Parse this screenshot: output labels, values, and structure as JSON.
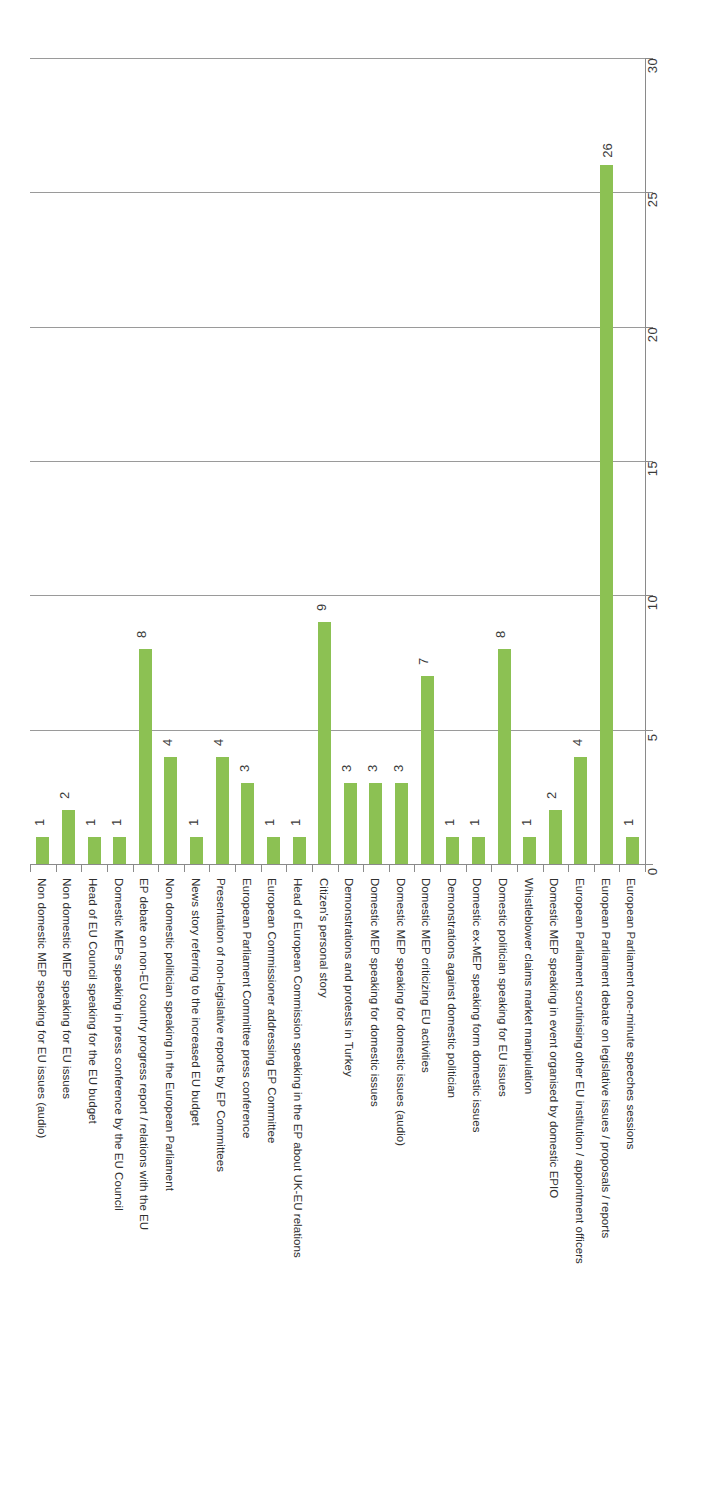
{
  "chart_data": {
    "type": "bar",
    "title": "",
    "xlabel": "",
    "ylabel": "",
    "ylim": [
      0,
      30
    ],
    "ytick_values": [
      0,
      5,
      10,
      15,
      20,
      25,
      30
    ],
    "grid": true,
    "legend": "none",
    "orientation": "vertical-bars-rotated-page",
    "bar_color": "#8cc153",
    "gridline_color": "#9a9a9a",
    "axis_color": "#8a8a8a",
    "data_labels_shown": true,
    "categories": [
      "Non domestic MEP speaking for EU issues (audio)",
      "Non domestic MEP speaking for EU issues",
      "Head of EU Council speaking for the EU budget",
      "Domestic MEPs speaking in press conference by the EU Council",
      "EP debate on non-EU country progress report / relations with the EU",
      "Non domestic politician speaking in the European Parliament",
      "News story referring to the increased EU budget",
      "Presentation of non-legislative reports by EP Committees",
      "European Parliament Committee press conference",
      "European Commissioner addressing EP Committee",
      "Head of European Commission speaking in the EP about UK-EU relations",
      "Citizen's personal story",
      "Demonstrations and protests in Turkey",
      "Domestic MEP speaking for domestic issues",
      "Domestic MEP speaking for domestic issues (audio)",
      "Domestic MEP criticizing EU activities",
      "Demonstrations against domestic politician",
      "Domestic ex-MEP speaking form domestic issues",
      "Domestic politician speaking for EU issues",
      "Whistleblower claims market manipulation",
      "Domestic MEP speaking in event organised by domestic EPIO",
      "European Parliament scrutinising other EU institution / appointment officers",
      "European Parliament debate on legislative issues / proposals / reports",
      "European Parliament one-minute speeches sessions"
    ],
    "values": [
      1,
      2,
      1,
      1,
      8,
      4,
      1,
      4,
      3,
      1,
      1,
      9,
      3,
      3,
      3,
      7,
      1,
      1,
      8,
      1,
      2,
      4,
      26,
      1
    ]
  }
}
